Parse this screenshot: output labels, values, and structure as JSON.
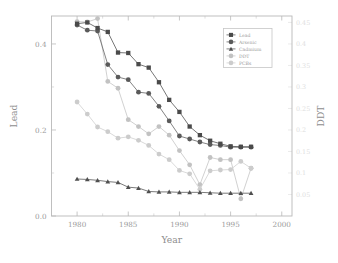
{
  "chart_data": {
    "type": "line",
    "title": "",
    "xlabel": "Year",
    "ylabel": "Lead",
    "ylabel_right": "DDT",
    "xlim": [
      1977.5,
      2001.0
    ],
    "ylim": [
      0.0,
      0.465
    ],
    "ylim_right": [
      0.0,
      0.465
    ],
    "grid": false,
    "legend_position": "top-right",
    "xticks": [
      1980,
      1985,
      1990,
      1995,
      2000
    ],
    "xtick_labels": [
      "1980",
      "1985",
      "1990",
      "1995",
      "2000"
    ],
    "xticks_minor": [
      1982.5,
      1987.5,
      1992.5,
      1997.5
    ],
    "yticks": [
      0.0,
      0.2,
      0.4
    ],
    "ytick_labels": [
      "0.0",
      "0.2",
      "0.4"
    ],
    "yticks_minor": [
      0.1,
      0.3
    ],
    "yticks_right": [
      0.05,
      0.1,
      0.15,
      0.2,
      0.25,
      0.3,
      0.35,
      0.4,
      0.45
    ],
    "ytick_labels_right": [
      "0.05",
      "0.1",
      "0.15",
      "0.2",
      "0.25",
      "0.3",
      "0.35",
      "0.4",
      "0.45"
    ],
    "x": [
      1980,
      1981,
      1982,
      1983,
      1984,
      1985,
      1986,
      1987,
      1988,
      1989,
      1990,
      1991,
      1992,
      1993,
      1994,
      1995,
      1996,
      1997
    ],
    "series": [
      {
        "name": "Lead",
        "marker": "square",
        "color": "#4a4a4a",
        "values": [
          0.447,
          0.45,
          0.437,
          0.428,
          0.38,
          0.379,
          0.353,
          0.345,
          0.311,
          0.27,
          0.242,
          0.208,
          0.188,
          0.175,
          0.168,
          0.162,
          0.161,
          0.161
        ]
      },
      {
        "name": "Arsenic",
        "marker": "circle",
        "color": "#5a5a5a",
        "values": [
          0.444,
          0.432,
          0.43,
          0.352,
          0.323,
          0.317,
          0.288,
          0.285,
          0.255,
          0.221,
          0.186,
          0.179,
          0.172,
          0.166,
          0.164,
          0.16,
          0.16,
          0.16
        ]
      },
      {
        "name": "Cadmium",
        "marker": "triangle",
        "color": "#4f4f4f",
        "values": [
          0.086,
          0.085,
          0.083,
          0.08,
          0.078,
          0.067,
          0.065,
          0.057,
          0.056,
          0.056,
          0.055,
          0.055,
          0.055,
          0.054,
          0.053,
          0.053,
          0.053,
          0.053
        ]
      },
      {
        "name": "DDT",
        "marker": "circle",
        "color": "#c2c2c2",
        "values": [
          0.452,
          0.451,
          0.459,
          0.313,
          0.297,
          0.224,
          0.208,
          0.191,
          0.208,
          0.188,
          0.152,
          0.119,
          0.073,
          0.136,
          0.131,
          0.131,
          0.04,
          0.111
        ]
      },
      {
        "name": "PCBs",
        "marker": "circle",
        "color": "#cccccc",
        "values": [
          0.265,
          0.237,
          0.207,
          0.196,
          0.181,
          0.184,
          0.176,
          0.164,
          0.144,
          0.131,
          0.106,
          0.098,
          0.062,
          0.105,
          0.107,
          0.108,
          0.127,
          0.111
        ]
      }
    ]
  },
  "legend": {
    "entries": [
      {
        "label": "Lead"
      },
      {
        "label": "Arsenic"
      },
      {
        "label": "Cadmium"
      },
      {
        "label": "DDT"
      },
      {
        "label": "PCBs"
      }
    ]
  },
  "axes": {
    "x_title": "Year",
    "y_title": "Lead",
    "y_right_title": "DDT"
  }
}
